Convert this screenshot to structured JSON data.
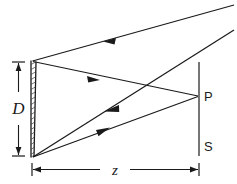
{
  "figure": {
    "type": "optics-ray-diagram",
    "background_color": "#ffffff",
    "line_color": "#1a1a1a"
  },
  "labels": {
    "aperture_diameter": "D",
    "distance": "z",
    "point": "P",
    "screen": "S"
  },
  "elements": {
    "aperture_name": "hatched-aperture",
    "screen_name": "observation-screen",
    "diameter_dimension_name": "diameter-dimension",
    "distance_dimension_name": "distance-dimension"
  },
  "geometry": {
    "aperture_x": 32,
    "aperture_top_y": 61,
    "aperture_bottom_y": 157,
    "screen_x": 199,
    "screen_top_y": 62,
    "screen_bottom_y": 156,
    "point_p_y": 96,
    "label_s_y": 146
  },
  "rays": [
    {
      "name": "ray-top-incoming",
      "from": "upper-right-offscreen",
      "to": "aperture-top",
      "direction": "leftward",
      "arrow_at": "midpoint"
    },
    {
      "name": "ray-aperture-top-to-p",
      "from": "aperture-top",
      "to": "point-P",
      "direction": "rightward",
      "arrow_at": "midpoint"
    },
    {
      "name": "ray-incoming-to-aperture-bottom",
      "from": "upper-right-offscreen",
      "to": "aperture-bottom",
      "direction": "leftward-downward",
      "arrow_at": "midpoint"
    },
    {
      "name": "ray-aperture-bottom-to-p",
      "from": "aperture-bottom",
      "to": "point-P",
      "direction": "rightward-upward",
      "arrow_at": "midpoint"
    }
  ]
}
